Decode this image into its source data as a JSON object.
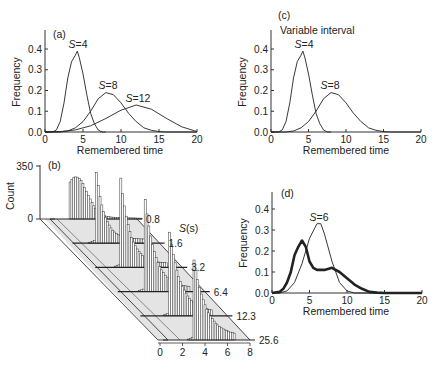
{
  "figure": {
    "panels": [
      {
        "id": "a",
        "label": "(a)"
      },
      {
        "id": "b",
        "label": "(b)"
      },
      {
        "id": "c",
        "label": "(c)",
        "subtitle": "Variable interval"
      },
      {
        "id": "d",
        "label": "(d)"
      }
    ]
  },
  "chart_data": [
    {
      "panel": "(a)",
      "type": "line",
      "title": "",
      "xlabel": "Remembered time",
      "ylabel": "Frequency",
      "xlim": [
        0,
        20
      ],
      "ylim": [
        0,
        0.45
      ],
      "xticks": [
        "0",
        "5",
        "10",
        "15",
        "20"
      ],
      "yticks": [
        "0.0",
        "0.1",
        "0.2",
        "0.3",
        "0.4"
      ],
      "grid": false,
      "annotations": [
        "S=4",
        "S=8",
        "S=12"
      ],
      "series": [
        {
          "name": "S=4",
          "x": [
            0,
            1,
            1.5,
            2,
            2.5,
            3,
            3.5,
            4,
            4.25,
            4.5,
            5,
            5.5,
            6,
            6.5,
            7,
            7.5,
            8
          ],
          "y": [
            0,
            0,
            0.01,
            0.05,
            0.14,
            0.26,
            0.34,
            0.37,
            0.39,
            0.36,
            0.28,
            0.18,
            0.09,
            0.04,
            0.01,
            0,
            0
          ]
        },
        {
          "name": "S=8",
          "x": [
            0,
            2,
            3,
            4,
            5,
            6,
            7,
            8,
            9,
            10,
            11,
            12,
            13,
            14,
            15,
            16,
            20
          ],
          "y": [
            0,
            0,
            0.005,
            0.02,
            0.05,
            0.1,
            0.16,
            0.19,
            0.18,
            0.14,
            0.09,
            0.05,
            0.02,
            0.008,
            0.002,
            0,
            0
          ]
        },
        {
          "name": "S=12",
          "x": [
            0,
            2,
            4,
            6,
            8,
            10,
            12,
            14,
            16,
            18,
            20
          ],
          "y": [
            0,
            0.002,
            0.01,
            0.03,
            0.065,
            0.105,
            0.13,
            0.11,
            0.065,
            0.025,
            0.002
          ]
        }
      ]
    },
    {
      "panel": "(b)",
      "type": "bar",
      "title": "",
      "xlabel": "",
      "ylabel": "Count",
      "depth_label": "S(s)",
      "yticks": [
        "0",
        "350"
      ],
      "xticks": [
        "0",
        "2",
        "4",
        "6",
        "8"
      ],
      "xlim": [
        0,
        8
      ],
      "rows": [
        "0.8",
        "1.6",
        "3.2",
        "6.4",
        "12.3",
        "25.6"
      ],
      "description": "3D stacked histograms of counts vs remembered time for each interval S"
    },
    {
      "panel": "(c)",
      "type": "line",
      "title": "Variable interval",
      "xlabel": "Remembered time",
      "ylabel": "Frequency",
      "xlim": [
        0,
        20
      ],
      "ylim": [
        0,
        0.45
      ],
      "xticks": [
        "0",
        "5",
        "10",
        "15",
        "20"
      ],
      "yticks": [
        "0.0",
        "0.1",
        "0.2",
        "0.3",
        "0.4"
      ],
      "grid": false,
      "annotations": [
        "S=4",
        "S=8"
      ],
      "series": [
        {
          "name": "S=4",
          "x": [
            0,
            1,
            1.5,
            2,
            2.5,
            3,
            3.5,
            4,
            4.25,
            4.5,
            5,
            5.5,
            6,
            6.5,
            7,
            7.5,
            8
          ],
          "y": [
            0,
            0,
            0.01,
            0.05,
            0.14,
            0.26,
            0.34,
            0.37,
            0.39,
            0.36,
            0.28,
            0.18,
            0.09,
            0.04,
            0.01,
            0,
            0
          ]
        },
        {
          "name": "S=8",
          "x": [
            0,
            2,
            3,
            4,
            5,
            6,
            7,
            8,
            9,
            10,
            11,
            12,
            13,
            14,
            15,
            16,
            20
          ],
          "y": [
            0,
            0,
            0.005,
            0.02,
            0.05,
            0.1,
            0.16,
            0.19,
            0.18,
            0.14,
            0.09,
            0.05,
            0.02,
            0.008,
            0.002,
            0,
            0
          ]
        }
      ]
    },
    {
      "panel": "(d)",
      "type": "line",
      "title": "",
      "xlabel": "Remembered time",
      "ylabel": "Frequency",
      "xlim": [
        0,
        20
      ],
      "ylim": [
        0,
        0.45
      ],
      "xticks": [
        "0",
        "5",
        "10",
        "15",
        "20"
      ],
      "yticks": [
        "0.0",
        "0.1",
        "0.2",
        "0.3",
        "0.4"
      ],
      "grid": false,
      "annotations": [
        "S=6"
      ],
      "series": [
        {
          "name": "S=6",
          "style": "thin",
          "x": [
            0,
            1,
            2,
            3,
            4,
            5,
            6,
            6.5,
            7,
            8,
            9,
            10,
            11,
            20
          ],
          "y": [
            0,
            0,
            0.01,
            0.05,
            0.14,
            0.26,
            0.33,
            0.33,
            0.28,
            0.15,
            0.05,
            0.01,
            0,
            0
          ]
        },
        {
          "name": "mixture",
          "style": "thick",
          "x": [
            0,
            1,
            1.5,
            2,
            2.5,
            3,
            3.5,
            4,
            4.5,
            5,
            5.5,
            6,
            7,
            8,
            9,
            10,
            11,
            12,
            13,
            14,
            15,
            20
          ],
          "y": [
            0,
            0.005,
            0.02,
            0.05,
            0.1,
            0.18,
            0.22,
            0.25,
            0.22,
            0.15,
            0.12,
            0.11,
            0.11,
            0.12,
            0.1,
            0.07,
            0.04,
            0.02,
            0.005,
            0.002,
            0,
            0
          ]
        }
      ]
    }
  ]
}
